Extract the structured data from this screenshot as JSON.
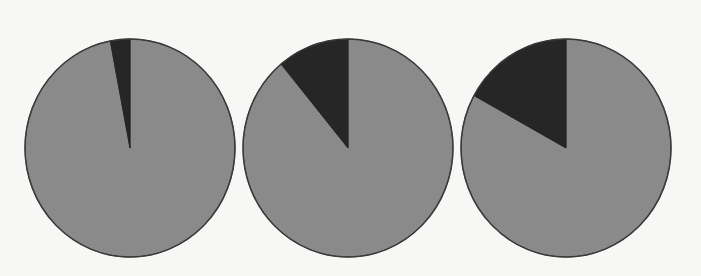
{
  "chart_data": [
    {
      "type": "pie",
      "title": "",
      "categories": [
        "Remainder",
        "Highlighted share"
      ],
      "values": [
        97,
        3
      ],
      "colors": [
        "#8a8a8a",
        "#262626"
      ],
      "center": [
        130,
        148
      ],
      "rx": 105,
      "ry": 109,
      "start_angle_deg": 0,
      "direction": "counterclockwise_highlight_from_top"
    },
    {
      "type": "pie",
      "title": "",
      "categories": [
        "Remainder",
        "Highlighted share"
      ],
      "values": [
        89,
        11
      ],
      "colors": [
        "#8a8a8a",
        "#262626"
      ],
      "center": [
        348,
        148
      ],
      "rx": 105,
      "ry": 109,
      "start_angle_deg": 0,
      "direction": "counterclockwise_highlight_from_top"
    },
    {
      "type": "pie",
      "title": "",
      "categories": [
        "Remainder",
        "Highlighted share"
      ],
      "values": [
        83,
        17
      ],
      "colors": [
        "#8a8a8a",
        "#262626"
      ],
      "center": [
        566,
        148
      ],
      "rx": 105,
      "ry": 109,
      "start_angle_deg": 0,
      "direction": "counterclockwise_highlight_from_top"
    }
  ],
  "style": {
    "background": "#f7f7f5",
    "outline": "#3a3a3a"
  }
}
